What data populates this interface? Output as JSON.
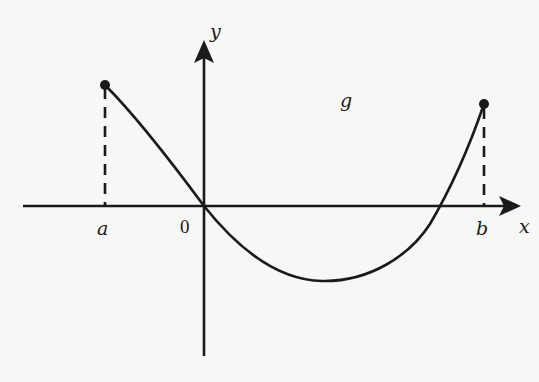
{
  "diagram": {
    "type": "function-graph",
    "axes": {
      "x_label": "x",
      "y_label": "y",
      "origin_label": "0"
    },
    "function_label": "g",
    "interval": {
      "left_label": "a",
      "right_label": "b"
    },
    "colors": {
      "ink": "#1a1a1a",
      "background": "#f7f7f5"
    }
  }
}
